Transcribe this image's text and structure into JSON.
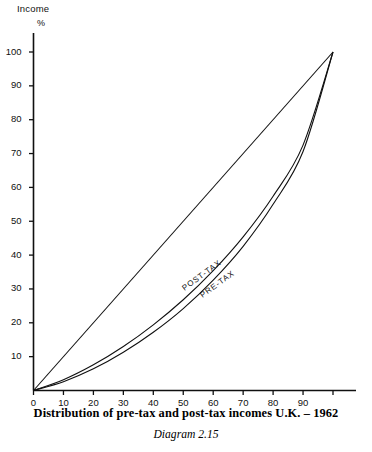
{
  "chart_data": {
    "type": "line",
    "title": "Distribution of pre-tax and post-tax incomes U.K. – 1962",
    "subtitle": "Diagram 2.15",
    "xlabel": "",
    "ylabel": "Income %",
    "xlim": [
      0,
      100
    ],
    "ylim": [
      0,
      100
    ],
    "grid": false,
    "legend_position": "inline-along-curves",
    "x_ticks": [
      0,
      10,
      20,
      30,
      40,
      50,
      60,
      70,
      80,
      90
    ],
    "x_tick_labels": [
      "0",
      "10",
      "20",
      "30",
      "40",
      "50",
      "60",
      "70",
      "80",
      "90"
    ],
    "y_ticks": [
      10,
      20,
      30,
      40,
      50,
      60,
      70,
      80,
      90,
      100
    ],
    "y_tick_labels": [
      "10",
      "20",
      "30",
      "40",
      "50",
      "60",
      "70",
      "80",
      "90",
      "100"
    ],
    "x": [
      0,
      10,
      20,
      30,
      40,
      50,
      60,
      70,
      80,
      90,
      100
    ],
    "series": [
      {
        "name": "Line of equality",
        "label": "",
        "values": [
          0,
          10,
          20,
          30,
          40,
          50,
          60,
          70,
          80,
          90,
          100
        ]
      },
      {
        "name": "POST-TAX",
        "label": "POST-TAX",
        "values": [
          0,
          3.2,
          7.6,
          13.0,
          19.4,
          26.8,
          35.4,
          45.4,
          57.4,
          72.5,
          100
        ]
      },
      {
        "name": "PRE-TAX",
        "label": "PRE-TAX",
        "values": [
          0,
          2.6,
          6.4,
          11.3,
          17.2,
          24.2,
          32.6,
          42.6,
          55.0,
          70.6,
          100
        ]
      }
    ],
    "annotations": [
      {
        "text": "POST-TAX",
        "x": 50,
        "y": 30
      },
      {
        "text": "PRE-TAX",
        "x": 56,
        "y": 28
      }
    ]
  },
  "axes": {
    "y_title_line1": "Income",
    "y_title_line2": "%"
  },
  "caption": {
    "main": "Distribution of pre-tax and post-tax incomes U.K. – 1962",
    "diagram": "Diagram 2.15"
  },
  "colors": {
    "ink": "#101010",
    "background": "#ffffff"
  }
}
